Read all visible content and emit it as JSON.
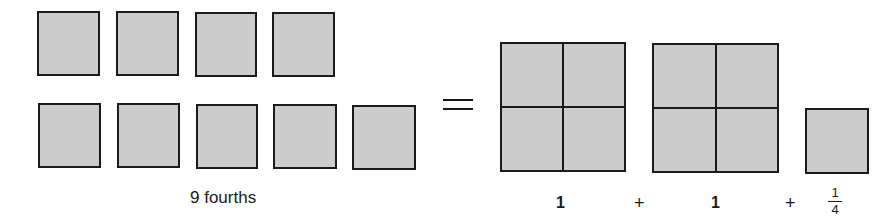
{
  "diagram": {
    "left_group": {
      "caption": "9 fourths",
      "row1_count": 4,
      "row2_count": 5
    },
    "equals_symbol": "=",
    "right_group": {
      "wholes": [
        {
          "label": "1",
          "parts": 4
        },
        {
          "label": "1",
          "parts": 4
        }
      ],
      "plus_1": "+",
      "plus_2": "+",
      "fraction": {
        "numerator": "1",
        "denominator": "4"
      }
    },
    "colors": {
      "fill": "#cccccc",
      "stroke": "#1a1a1a"
    }
  }
}
